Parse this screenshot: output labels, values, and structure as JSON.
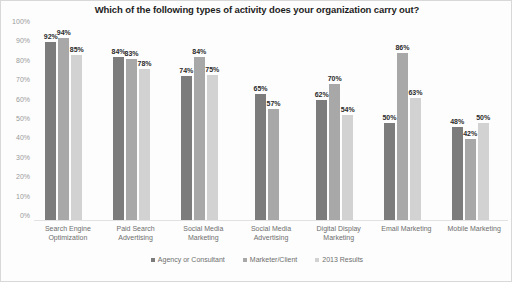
{
  "chart_data": {
    "type": "bar",
    "title": "Which of the following types of activity does your organization carry out?",
    "xlabel": "",
    "ylabel": "",
    "ylim": [
      0,
      100
    ],
    "ytick_labels": [
      "100%",
      "90%",
      "80%",
      "70%",
      "60%",
      "50%",
      "40%",
      "30%",
      "20%",
      "10%",
      "0%"
    ],
    "yticks": [
      100,
      90,
      80,
      70,
      60,
      50,
      40,
      30,
      20,
      10,
      0
    ],
    "grid": false,
    "legend_position": "bottom",
    "categories": [
      "Search Engine Optimization",
      "Paid Search Advertising",
      "Social Media Marketing",
      "Social Media Advertising",
      "Digital Display Marketing",
      "Email Marketing",
      "Mobile Marketing"
    ],
    "series": [
      {
        "name": "Agency or Consultant",
        "color": "#7c7c7c",
        "values": [
          92,
          84,
          74,
          65,
          62,
          50,
          48
        ],
        "labels": [
          "92%",
          "84%",
          "74%",
          "65%",
          "62%",
          "50%",
          "48%"
        ]
      },
      {
        "name": "Marketer/Client",
        "color": "#a8a8a8",
        "values": [
          94,
          83,
          84,
          57,
          70,
          86,
          42
        ],
        "labels": [
          "94%",
          "83%",
          "84%",
          "57%",
          "70%",
          "86%",
          "42%"
        ]
      },
      {
        "name": "2013 Results",
        "color": "#d2d2d2",
        "values": [
          85,
          78,
          75,
          null,
          54,
          63,
          50
        ],
        "labels": [
          "85%",
          "78%",
          "75%",
          "",
          "54%",
          "63%",
          "50%"
        ]
      }
    ]
  }
}
